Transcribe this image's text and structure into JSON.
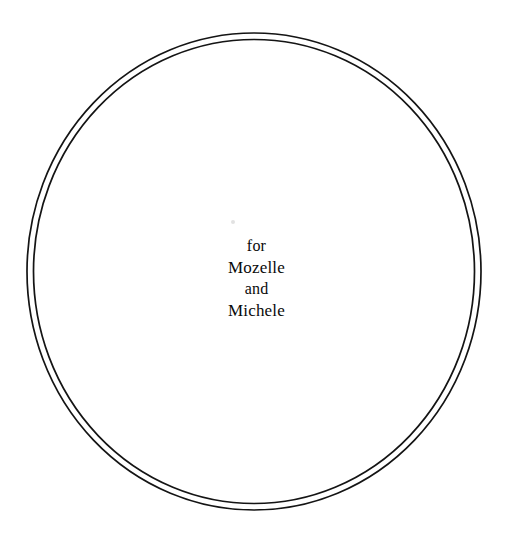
{
  "page": {
    "background_color": "#ffffff",
    "width": 513,
    "height": 540
  },
  "ring": {
    "name": "double-circle-border",
    "stroke_color": "#141414",
    "outer": {
      "cx": 254,
      "cy": 271.5,
      "rx": 227,
      "ry": 238.5,
      "stroke_width": 1.7
    },
    "inner": {
      "cx": 254,
      "cy": 271.5,
      "rx": 220.5,
      "ry": 232,
      "stroke_width": 1.7
    }
  },
  "dedication": {
    "lines": [
      {
        "text": "for",
        "emphasis": "small"
      },
      {
        "text": "Mozelle",
        "emphasis": "normal"
      },
      {
        "text": "and",
        "emphasis": "small"
      },
      {
        "text": "Michele",
        "emphasis": "normal"
      }
    ]
  },
  "artifact": {
    "name": "scan-speck",
    "color": "#e2e2e2"
  }
}
